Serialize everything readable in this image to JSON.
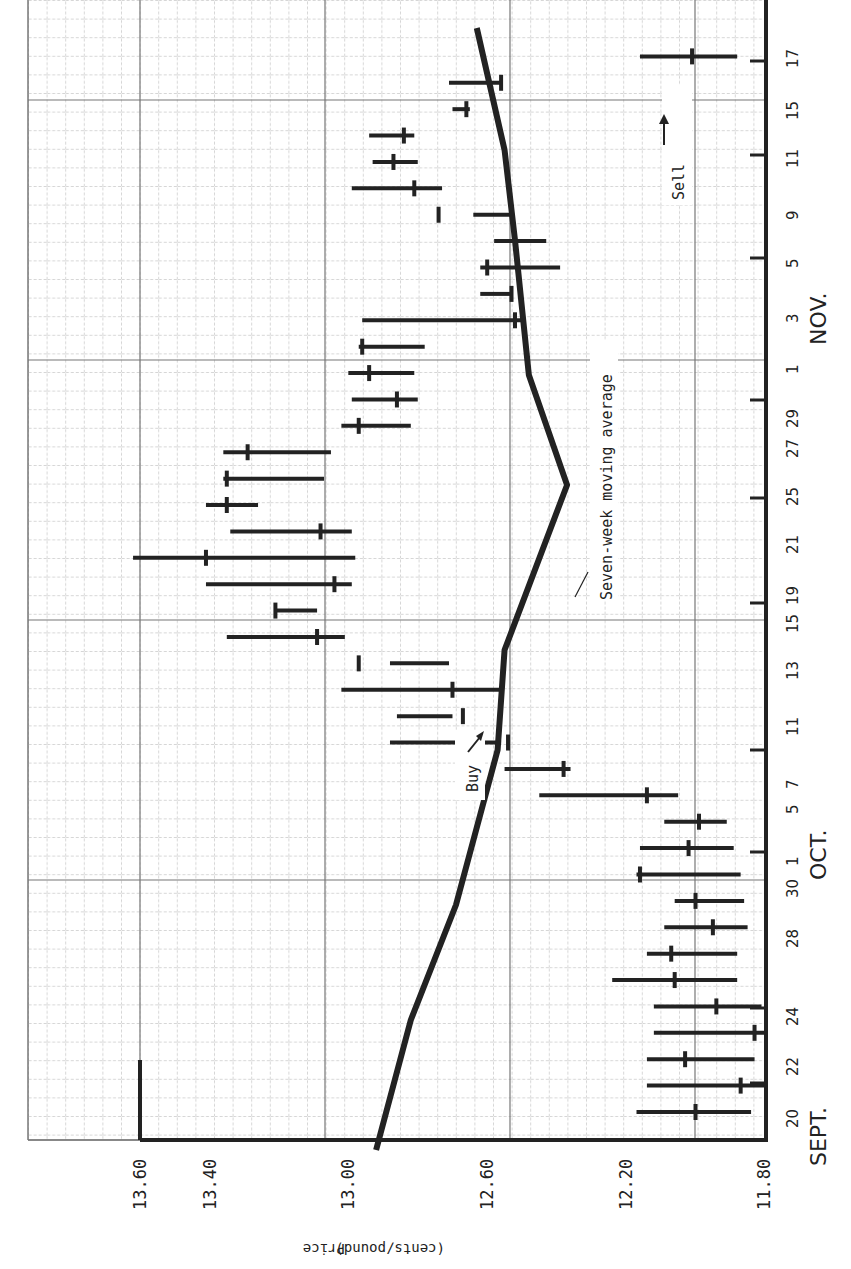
{
  "chart_data": {
    "type": "bar",
    "subtype": "high-low-close with moving average line",
    "orientation": "rotated 90 degrees counter-clockwise",
    "title": "",
    "xlabel": "",
    "ylabel": "Price (cents/pound)",
    "ylim": [
      11.8,
      13.6
    ],
    "yticks": [
      "13.60",
      "13.40",
      "13.00",
      "12.60",
      "12.20",
      "11.80"
    ],
    "months": [
      "SEPT.",
      "OCT.",
      "NOV."
    ],
    "categories": [
      "20",
      "22",
      "22b",
      "24",
      "24b",
      "28",
      "28b",
      "30",
      "30b",
      "1",
      "5",
      "5b",
      "7",
      "7b",
      "11",
      "11b",
      "13",
      "13b",
      "15",
      "15b",
      "19",
      "19b",
      "21",
      "21b",
      "25",
      "25b",
      "27",
      "27b",
      "29",
      "29b",
      "1",
      "1b",
      "3",
      "3b",
      "5",
      "5b",
      "9",
      "9b",
      "11",
      "11b",
      "15",
      "17"
    ],
    "tick_labels": [
      "20",
      "22",
      "24",
      "28",
      "30",
      "1",
      "5",
      "7",
      "11",
      "13",
      "15",
      "19",
      "21",
      "25",
      "27",
      "29",
      "1",
      "3",
      "5",
      "9",
      "11",
      "15",
      "17"
    ],
    "series": [
      {
        "name": "High",
        "values": [
          12.17,
          12.14,
          12.14,
          12.12,
          12.12,
          12.24,
          12.14,
          12.09,
          12.06,
          12.17,
          12.16,
          12.09,
          12.45,
          12.55,
          12.88,
          12.86,
          13.02,
          12.71,
          13.35,
          13.21,
          13.41,
          13.62,
          13.34,
          13.41,
          13.36,
          13.36,
          13.02,
          12.99,
          13.0,
          12.97,
          12.96,
          12.62,
          12.62,
          12.58,
          12.64,
          12.99,
          12.93,
          12.94,
          12.7,
          12.71,
          12.16,
          12.6
        ]
      },
      {
        "name": "Low",
        "values": [
          11.84,
          11.8,
          11.83,
          11.8,
          11.81,
          11.88,
          11.88,
          11.85,
          11.86,
          11.87,
          11.89,
          11.91,
          12.05,
          12.36,
          12.56,
          12.7,
          12.56,
          12.88,
          13.01,
          13.09,
          12.99,
          12.98,
          12.99,
          13.26,
          13.07,
          13.05,
          12.82,
          12.8,
          12.81,
          12.78,
          12.5,
          12.53,
          12.39,
          12.43,
          12.53,
          12.73,
          12.8,
          12.81,
          12.65,
          12.56,
          11.88,
          12.6
        ]
      },
      {
        "name": "Close",
        "values": [
          12.0,
          11.87,
          12.03,
          11.83,
          11.94,
          12.06,
          12.07,
          11.95,
          12.0,
          12.16,
          12.02,
          11.99,
          12.14,
          12.38,
          12.54,
          12.67,
          12.7,
          12.97,
          13.09,
          13.21,
          13.04,
          13.41,
          13.08,
          13.35,
          13.35,
          13.29,
          12.97,
          12.86,
          12.94,
          12.96,
          12.52,
          12.53,
          12.6,
          12.52,
          12.74,
          12.81,
          12.87,
          12.84,
          12.66,
          12.56,
          12.01,
          12.6
        ]
      },
      {
        "name": "Seven-week moving average",
        "type": "line",
        "points": [
          {
            "date": "Sept 20",
            "value": 12.92
          },
          {
            "date": "Sept 24",
            "value": 12.82
          },
          {
            "date": "Sept 30",
            "value": 12.69
          },
          {
            "date": "Oct 7",
            "value": 12.57
          },
          {
            "date": "Oct 13",
            "value": 12.55
          },
          {
            "date": "Oct 21",
            "value": 12.37
          },
          {
            "date": "Oct 29",
            "value": 12.48
          },
          {
            "date": "Nov 5",
            "value": 12.52
          },
          {
            "date": "Nov 11",
            "value": 12.55
          },
          {
            "date": "Nov 17",
            "value": 12.63
          }
        ]
      }
    ],
    "annotations": [
      {
        "text": "Buy",
        "target": "Oct 11 bar close ~12.67"
      },
      {
        "text": "Sell",
        "target": "Nov 15 bar close ~12.01"
      },
      {
        "text": "Seven-week moving average",
        "target": "moving average line near Oct 19"
      }
    ],
    "grid": true,
    "legend": "none"
  },
  "labels": {
    "axis_title_price": "Price",
    "axis_title_unit": "(cents/pound)",
    "buy": "Buy",
    "sell": "Sell",
    "ma": "Seven-week moving average",
    "header_cut": "this is a sell signal."
  }
}
